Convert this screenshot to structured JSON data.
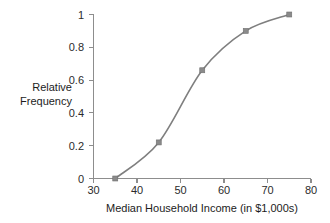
{
  "chart_data": {
    "type": "line",
    "title": "",
    "subtitle": "",
    "xlabel": "Median Household Income (in $1,000s)",
    "ylabel": "Relative Frequency",
    "ylabel_line1": "Relative",
    "ylabel_line2": "Frequency",
    "x": [
      35,
      45,
      55,
      65,
      75
    ],
    "values": [
      0,
      0.22,
      0.66,
      0.9,
      1.0
    ],
    "series": [
      {
        "name": "Relative Frequency",
        "x": [
          35,
          45,
          55,
          65,
          75
        ],
        "values": [
          0,
          0.22,
          0.66,
          0.9,
          1.0
        ]
      }
    ],
    "xlim": [
      30,
      80
    ],
    "ylim": [
      0,
      1
    ],
    "xticks": [
      30,
      40,
      50,
      60,
      70,
      80
    ],
    "xtick_labels": [
      "30",
      "40",
      "50",
      "60",
      "70",
      "80"
    ],
    "yticks": [
      0,
      0.2,
      0.4,
      0.6,
      0.8,
      1
    ],
    "ytick_labels": [
      "0",
      "0.2",
      "0.4",
      "0.6",
      "0.8",
      "1"
    ],
    "grid": false,
    "legend": false,
    "legend_position": "none",
    "marker": "square",
    "line_color": "#7f7f7f",
    "marker_color": "#8a8a8a",
    "axis_color": "#8d8d8d",
    "background_color": "#ffffff",
    "annotations": []
  }
}
